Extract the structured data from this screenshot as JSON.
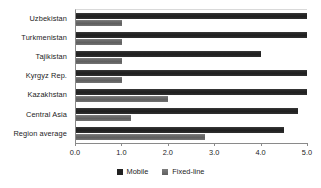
{
  "chart_data": {
    "type": "bar",
    "orientation": "horizontal",
    "title": "",
    "xlabel": "",
    "ylabel": "",
    "xlim": [
      0.0,
      5.0
    ],
    "grid": false,
    "legend_position": "bottom-center",
    "categories": [
      "Uzbekistan",
      "Turkmenistan",
      "Tajikistan",
      "Kyrgyz Rep.",
      "Kazakhstan",
      "Central Asia",
      "Region average"
    ],
    "series": [
      {
        "name": "Mobile",
        "color": "#222222",
        "values": [
          5.0,
          5.0,
          4.0,
          5.0,
          5.0,
          4.8,
          4.5
        ]
      },
      {
        "name": "Fixed-line",
        "color": "#6d6d6d",
        "values": [
          1.0,
          1.0,
          1.0,
          1.0,
          2.0,
          1.2,
          2.8
        ]
      }
    ],
    "xticks": [
      0.0,
      1.0,
      2.0,
      3.0,
      4.0,
      5.0
    ],
    "xtick_labels": [
      "0.0",
      "1.0",
      "2.0",
      "3.0",
      "4.0",
      "5.0"
    ]
  },
  "legend": {
    "items": [
      {
        "label": "Mobile",
        "swatch": "mobile-swatch"
      },
      {
        "label": "Fixed-line",
        "swatch": "fixed-line-swatch"
      }
    ]
  }
}
